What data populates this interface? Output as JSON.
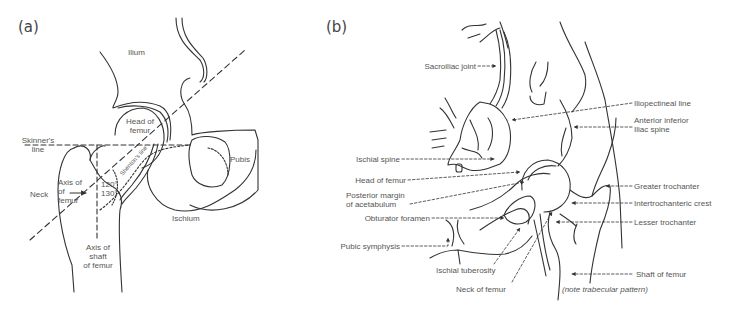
{
  "panel_a": {
    "tag": "(a)",
    "labels": {
      "ilium": "Ilium",
      "head_of_femur_1": "Head of",
      "head_of_femur_2": "femur",
      "skinners_1": "Skinner's",
      "skinners_2": "line",
      "pubis": "Pubis",
      "neck": "Neck",
      "axis_femur_1": "Axis of",
      "axis_femur_2": "of",
      "axis_femur_3": "femur",
      "angle_1": "120°",
      "angle_2": "130°",
      "shentons_line": "Shenton's line",
      "ischium": "Ischium",
      "axis_shaft_1": "Axis of",
      "axis_shaft_2": "shaft",
      "axis_shaft_3": "of femur"
    }
  },
  "panel_b": {
    "tag": "(b)",
    "labels": {
      "sacroiliac_joint": "Sacroiliac joint",
      "iliopectineal_line": "Iliopectineal line",
      "anterior_inferior_1": "Anterior inferior",
      "anterior_inferior_2": "Iliac spine",
      "ischial_spine": "Ischial spine",
      "head_of_femur": "Head of femur",
      "posterior_margin_1": "Posterior margin",
      "posterior_margin_2": "of acetabulum",
      "obturator_foramen": "Obturator foramen",
      "pubic_symphysis": "Pubic symphysis",
      "ischial_tuberosity": "Ischial tuberosity",
      "neck_of_femur": "Neck of femur",
      "greater_trochanter": "Greater trochanter",
      "intertrochanteric_crest": "Intertrochanteric crest",
      "lesser_trochanter": "Lesser trochanter",
      "shaft_of_femur": "Shaft of femur",
      "note": "(note trabecular pattern)"
    }
  }
}
